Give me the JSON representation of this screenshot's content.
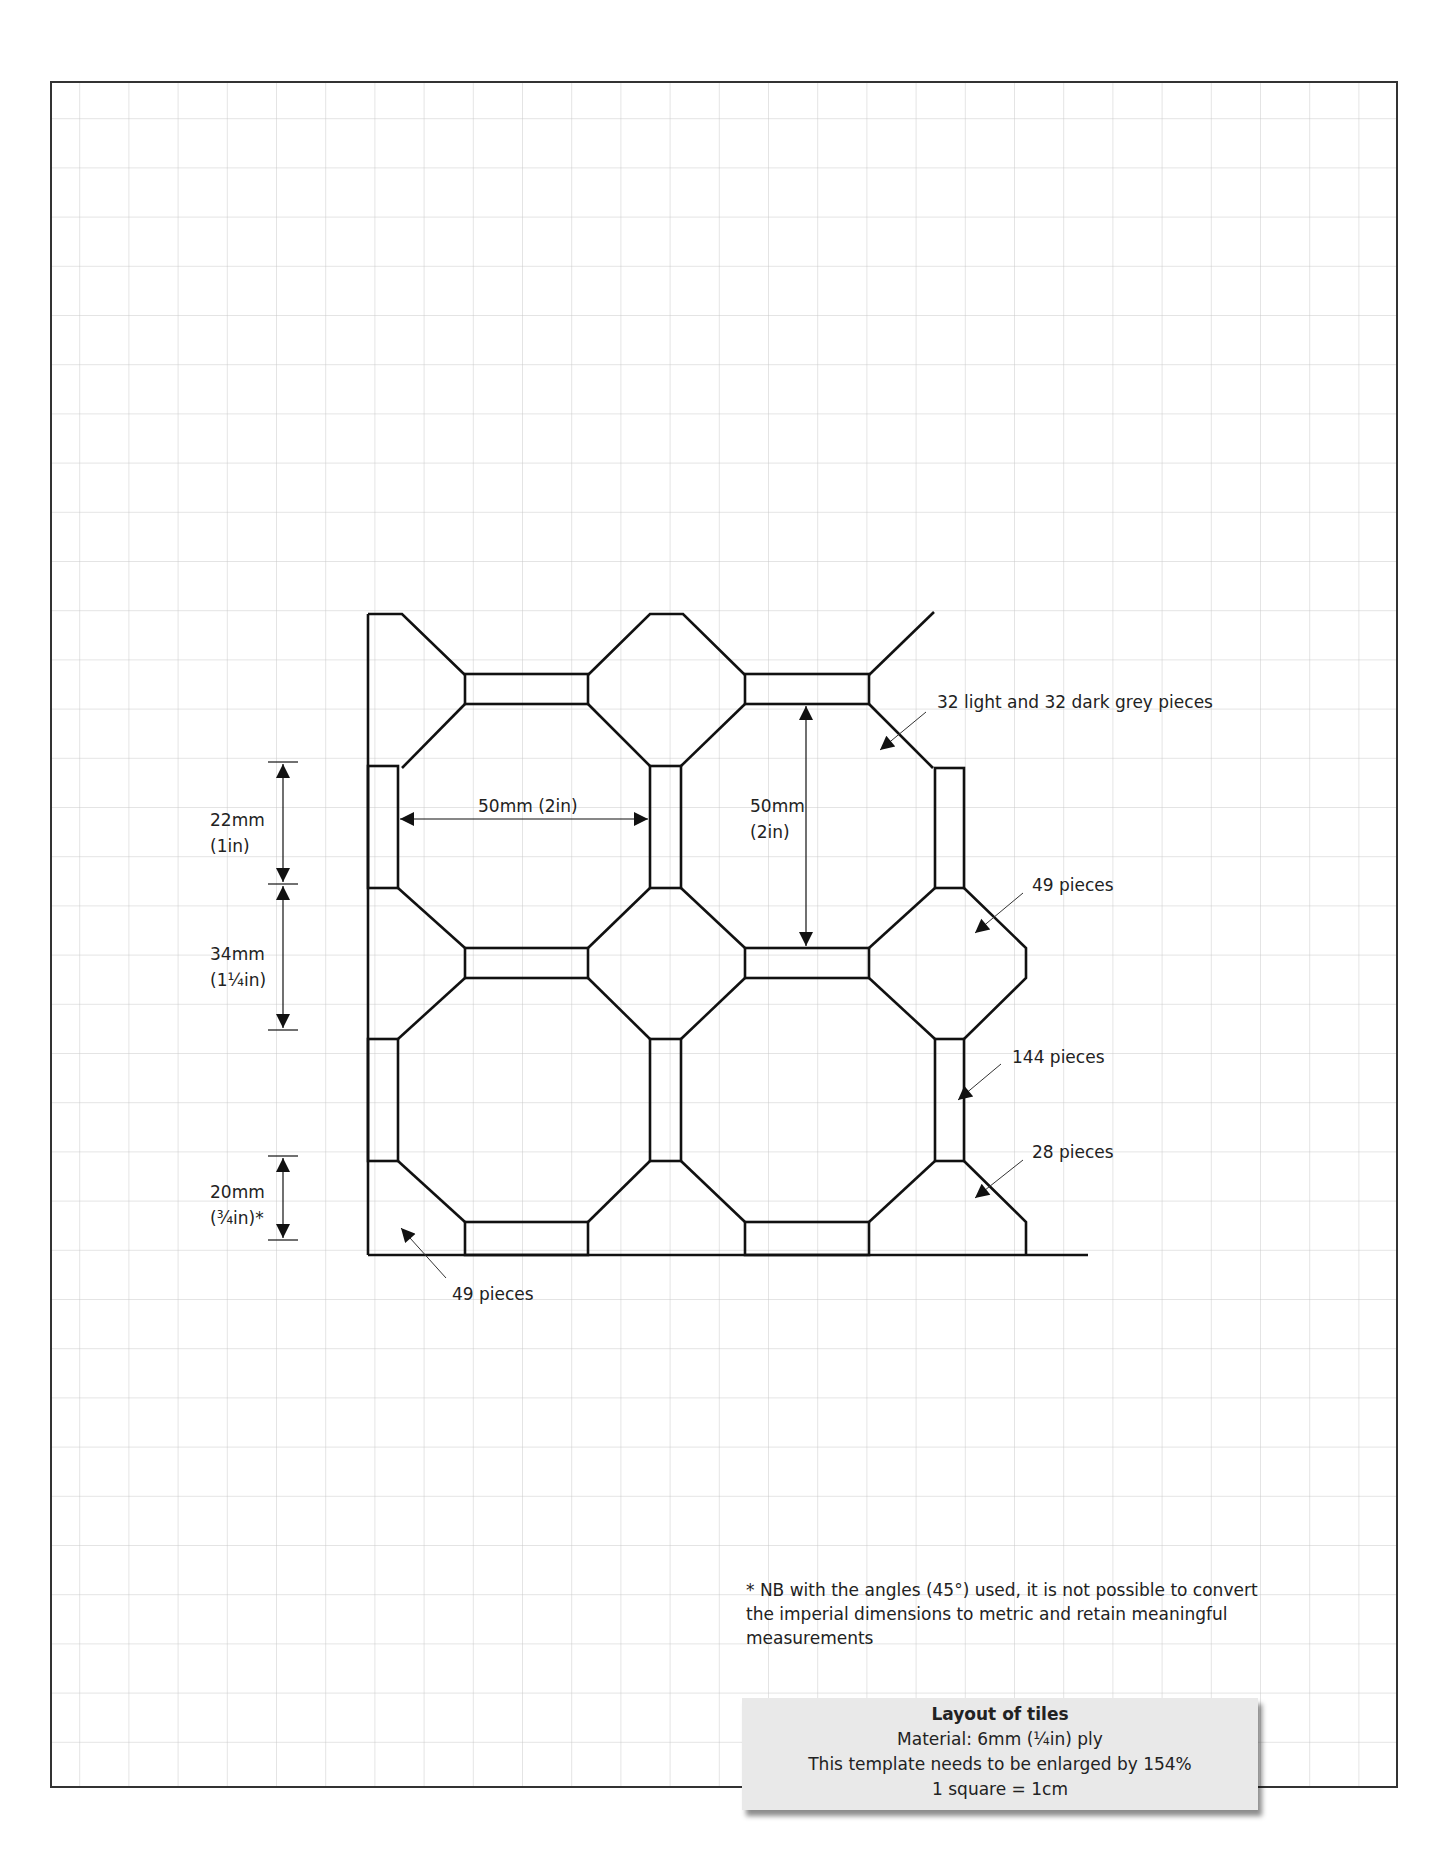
{
  "figure": {
    "title": "Layout of tiles",
    "material": "Material:  6mm (¼in) ply",
    "enlarge_note": "This template needs to be enlarged by 154%",
    "scale": "1 square = 1cm",
    "footnote": "* NB with the angles (45°) used, it is not possible to convert the imperial dimensions to metric and retain meaningful measurements"
  },
  "dimensions": {
    "d1_mm": "22mm",
    "d1_in": "(1in)",
    "d2_mm": "34mm",
    "d2_in": "(1¼in)",
    "d3_mm": "20mm",
    "d3_in": "(¾in)*",
    "width_label": "50mm (2in)",
    "height_mm": "50mm",
    "height_in": "(2in)"
  },
  "callouts": {
    "octagons": "32 light and 32 dark grey pieces",
    "squares": "49 pieces",
    "bars": "144 pieces",
    "edge_pieces": "28 pieces",
    "corner_pieces": "49 pieces"
  },
  "colors": {
    "grid": "#c8c8c8",
    "frame": "#333333",
    "ink": "#111111",
    "caption_bg": "#e9e9e9"
  }
}
